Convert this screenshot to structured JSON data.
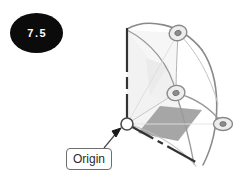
{
  "figure": {
    "badge_number": "7.5",
    "badge_bg_color": "#0b0b0b",
    "badge_text_color": "#ffffff",
    "background_color": "#ffffff"
  },
  "diagram": {
    "type": "3d-wireframe-spherical-sector",
    "line_color": "#6e6e6e",
    "axis_color": "#3a3a3a",
    "plane_fill_color": "#9a9a9a",
    "sector_fill_color": "#efefef",
    "node_fill_color": "#e8e8e8",
    "node_core_color": "#7a7a7a",
    "origin_marker_fill": "#ffffff",
    "nodes": [
      {
        "name": "top-node",
        "x": 178,
        "y": 33
      },
      {
        "name": "middle-node",
        "x": 176,
        "y": 93
      },
      {
        "name": "right-node",
        "x": 223,
        "y": 124
      },
      {
        "name": "origin-node",
        "x": 127,
        "y": 124
      }
    ],
    "axes": [
      {
        "name": "vertical-axis",
        "from_x": 127,
        "from_y": 28,
        "to_x": 127,
        "to_y": 124,
        "style": "dashed"
      },
      {
        "name": "depth-axis",
        "from_x": 127,
        "from_y": 124,
        "to_x": 203,
        "to_y": 166,
        "style": "dashed"
      }
    ]
  },
  "callout": {
    "label": "Origin",
    "border_color": "#6e6e6e",
    "text_color": "#2b2b2b",
    "leader": {
      "from_x": 104,
      "from_y": 148,
      "to_x": 119,
      "to_y": 130
    }
  }
}
